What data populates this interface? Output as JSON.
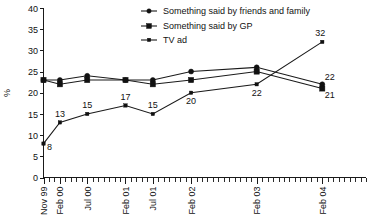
{
  "chart_data": {
    "type": "line",
    "title": "",
    "subtitle": "",
    "xlabel": "",
    "ylabel": "%",
    "ylim": [
      0,
      40
    ],
    "ytick_step": 5,
    "yticks": [
      "0",
      "5",
      "10",
      "15",
      "20",
      "25",
      "30",
      "35",
      "40"
    ],
    "grid": false,
    "legend_position": "top-center",
    "categories": [
      "Nov 99",
      "Feb 00",
      "Jul 00",
      "Feb 01",
      "Jul 01",
      "Feb 02",
      "Feb 03",
      "Feb 04"
    ],
    "series": [
      {
        "name": "Something said by friends and family",
        "marker": "circle",
        "values": [
          23,
          23,
          24,
          23,
          23,
          25,
          26,
          22
        ],
        "labels": [
          "",
          "",
          "",
          "",
          "",
          "",
          "",
          "22"
        ]
      },
      {
        "name": "Something said by GP",
        "marker": "square",
        "values": [
          23,
          22,
          23,
          23,
          22,
          23,
          25,
          21
        ],
        "labels": [
          "",
          "",
          "",
          "",
          "",
          "",
          "",
          "21"
        ]
      },
      {
        "name": "TV ad",
        "marker": "small-square",
        "values": [
          8,
          13,
          15,
          17,
          15,
          20,
          22,
          32
        ],
        "labels": [
          "8",
          "13",
          "15",
          "17",
          "15",
          "20",
          "22",
          "32"
        ]
      }
    ],
    "annotations": [
      {
        "text": "8",
        "series": "TV ad",
        "category": "Nov 99"
      },
      {
        "text": "13",
        "series": "TV ad",
        "category": "Feb 00"
      },
      {
        "text": "15",
        "series": "TV ad",
        "category": "Jul 00"
      },
      {
        "text": "17",
        "series": "TV ad",
        "category": "Feb 01"
      },
      {
        "text": "15",
        "series": "TV ad",
        "category": "Jul 01"
      },
      {
        "text": "20",
        "series": "TV ad",
        "category": "Feb 02"
      },
      {
        "text": "22",
        "series": "TV ad",
        "category": "Feb 03"
      },
      {
        "text": "32",
        "series": "TV ad",
        "category": "Feb 04"
      },
      {
        "text": "22",
        "series": "Something said by friends and family",
        "category": "Feb 04"
      },
      {
        "text": "21",
        "series": "Something said by GP",
        "category": "Feb 04"
      }
    ],
    "colors": {
      "line": "#1a1a1a",
      "marker": "#111111",
      "axis": "#1a1a1a",
      "background": "#ffffff",
      "text": "#111111"
    }
  },
  "legend": {
    "items": [
      {
        "label": "Something said by friends and family",
        "marker": "circle"
      },
      {
        "label": "Something said by GP",
        "marker": "square"
      },
      {
        "label": "TV ad",
        "marker": "small-square"
      }
    ]
  },
  "axis": {
    "y_title": "%",
    "y_ticks": [
      "40",
      "35",
      "30",
      "25",
      "20",
      "15",
      "10",
      "5",
      "0"
    ],
    "x_ticks": [
      "Nov 99",
      "Feb 00",
      "Jul 00",
      "Feb 01",
      "Jul 01",
      "Feb 02",
      "Feb 03",
      "Feb 04"
    ]
  }
}
